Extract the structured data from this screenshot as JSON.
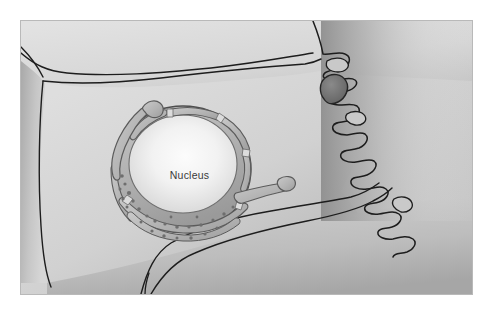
{
  "figure": {
    "kind": "cell-biology-illustration",
    "labels": [
      {
        "id": "nucleus",
        "text": "Nucleus",
        "color": "#3a3a3a"
      }
    ],
    "frame": {
      "border_color": "#b9b9b9",
      "background_color": "#ffffff",
      "margin_px": 20
    },
    "palette": {
      "cytoplasm_light": "#dcdcdc",
      "cytoplasm_mid": "#cacaca",
      "cytoplasm_shadow": "#a8a8a8",
      "cytoplasm_deep_shadow": "#8e8e8e",
      "membrane_outline": "#1d1d1d",
      "envelope_fill": "#b4b4b4",
      "envelope_outline": "#5b5b5b",
      "nucleoplasm_center": "#fbfbfb",
      "nucleoplasm_edge": "#cfcfcf",
      "ribosome_dot": "#6e6e6e",
      "vesicle_dark": "#6b6b6b"
    },
    "structures": [
      {
        "name": "plasma-membrane",
        "description": "Outer cell boundary with ruffled right edge"
      },
      {
        "name": "membrane-ruffles",
        "description": "Finger-like folds along the right margin"
      },
      {
        "name": "membrane-vesicle",
        "description": "Dark teardrop vesicle budding at the right edge"
      },
      {
        "name": "cytoplasm",
        "description": "Shaded interior of the cell"
      },
      {
        "name": "nucleus",
        "description": "Large ovoid organelle near the centre"
      },
      {
        "name": "nuclear-envelope",
        "description": "Double membrane ring studded with ribosomes"
      },
      {
        "name": "nuclear-pore",
        "description": "Gaps interrupting the envelope ring"
      },
      {
        "name": "ribosomes",
        "description": "Small dots along the lower envelope"
      },
      {
        "name": "er-tubule-left",
        "description": "Curved tubule hooking from the upper-left of the envelope"
      },
      {
        "name": "er-tubule-right",
        "description": "Tubule extending to the right of the envelope"
      },
      {
        "name": "cytoplasm-folds",
        "description": "Contour lines describing surface folds of the cell"
      }
    ]
  }
}
